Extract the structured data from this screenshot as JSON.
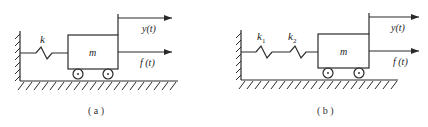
{
  "figures": [
    {
      "id": "a",
      "caption": "( a )",
      "labels": {
        "spring": "k",
        "mass": "m",
        "displacement": "y(t)",
        "force": "f (t)"
      },
      "springs": [
        "k"
      ]
    },
    {
      "id": "b",
      "caption": "( b )",
      "labels": {
        "spring1": "k",
        "spring1_sub": "1",
        "spring2": "k",
        "spring2_sub": "2",
        "mass": "m",
        "displacement": "y(t)",
        "force": "f (t)"
      },
      "springs": [
        "k1",
        "k2"
      ]
    }
  ],
  "colors": {
    "line": "#2a2a2a",
    "background": "#ffffff"
  }
}
